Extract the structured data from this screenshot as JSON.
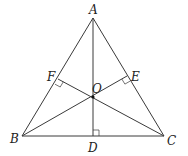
{
  "diagram": {
    "type": "geometry",
    "colors": {
      "stroke": "#3a3a3a",
      "label": "#222222",
      "background": "#ffffff"
    },
    "points": {
      "A": {
        "label": "A",
        "x": 93,
        "y": 18
      },
      "B": {
        "label": "B",
        "x": 22,
        "y": 136
      },
      "C": {
        "label": "C",
        "x": 164,
        "y": 136
      },
      "D": {
        "label": "D",
        "x": 93,
        "y": 136
      },
      "E": {
        "label": "E",
        "x": 127,
        "y": 76
      },
      "F": {
        "label": "F",
        "x": 58,
        "y": 79
      },
      "O": {
        "label": "O",
        "x": 93,
        "y": 97
      }
    },
    "segments": [
      [
        "A",
        "B"
      ],
      [
        "A",
        "C"
      ],
      [
        "B",
        "C"
      ],
      [
        "A",
        "D"
      ],
      [
        "B",
        "E"
      ],
      [
        "C",
        "F"
      ]
    ],
    "right_angles": [
      "D",
      "E",
      "F"
    ],
    "labels": {
      "A": "A",
      "B": "B",
      "C": "C",
      "D": "D",
      "E": "E",
      "F": "F",
      "O": "O"
    }
  }
}
